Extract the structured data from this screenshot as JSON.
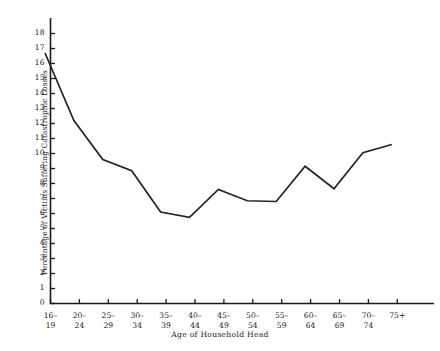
{
  "chart_data": {
    "type": "line",
    "title": "",
    "subtitle": "",
    "xlabel": "Age of Household Head",
    "ylabel": "Percentage of Victims Suffering Catastrophic Losses",
    "categories": [
      "16–\n19",
      "20–\n24",
      "25–\n29",
      "30–\n34",
      "35–\n39",
      "40–\n44",
      "45–\n49",
      "50–\n54",
      "55–\n59",
      "60–\n64",
      "65–\n69",
      "70–\n74",
      "75+"
    ],
    "xtick_labels": [
      {
        "line1": "16–",
        "line2": "19"
      },
      {
        "line1": "20–",
        "line2": "24"
      },
      {
        "line1": "25–",
        "line2": "29"
      },
      {
        "line1": "30–",
        "line2": "34"
      },
      {
        "line1": "35–",
        "line2": "39"
      },
      {
        "line1": "40–",
        "line2": "44"
      },
      {
        "line1": "45–",
        "line2": "49"
      },
      {
        "line1": "50–",
        "line2": "54"
      },
      {
        "line1": "55–",
        "line2": "59"
      },
      {
        "line1": "60–",
        "line2": "64"
      },
      {
        "line1": "65–",
        "line2": "69"
      },
      {
        "line1": "70–",
        "line2": "74"
      },
      {
        "line1": "75+",
        "line2": ""
      }
    ],
    "values": [
      16.7,
      12.2,
      9.6,
      8.85,
      6.1,
      5.75,
      7.6,
      6.85,
      6.8,
      9.15,
      7.65,
      10.05,
      10.6
    ],
    "ylim": [
      0,
      19
    ],
    "ytick_labels": [
      "0",
      "1",
      "2",
      "3",
      "4",
      "5",
      "6",
      "7",
      "8",
      "9",
      "10",
      "11",
      "12",
      "13",
      "14",
      "15",
      "16",
      "17",
      "18"
    ],
    "yticks": [
      0,
      1,
      2,
      3,
      4,
      5,
      6,
      7,
      8,
      9,
      10,
      11,
      12,
      13,
      14,
      15,
      16,
      17,
      18
    ],
    "grid": false,
    "legend": "none",
    "line_color": "#232323",
    "axis_color": "#1a1a1a",
    "background_color": "#ffffff"
  }
}
